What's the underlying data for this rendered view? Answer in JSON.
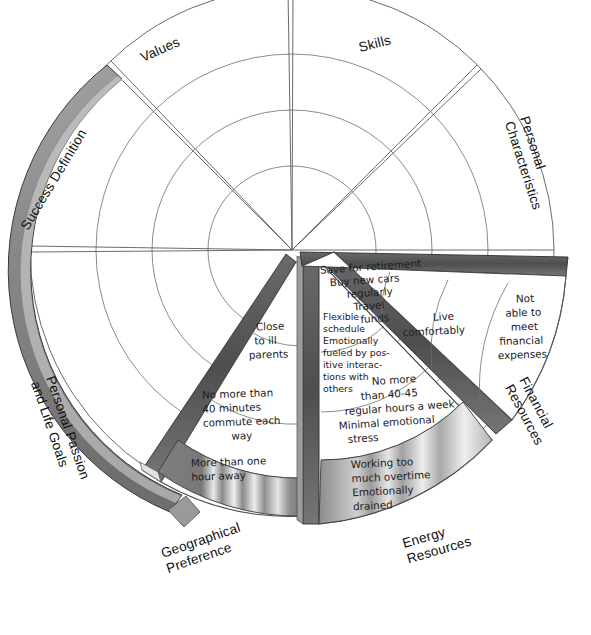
{
  "diagram": {
    "type": "segmented-wheel",
    "center": {
      "x": 292,
      "y": 250
    },
    "outer_radius": 262,
    "ring_radii": [
      84,
      140,
      196,
      262
    ],
    "ring_count": 3,
    "style": "hand-drawn pencil sketch, 3D exploded pie segments",
    "colors": {
      "ink": "#2e2e2e",
      "face": "#ffffff",
      "edge_dark": "#585858",
      "edge_mid": "#8d8d8d",
      "edge_light": "#c9c9c9",
      "background": "#ffffff"
    }
  },
  "sectors": [
    {
      "id": "skills",
      "label": "Skills",
      "label_lines": [
        "Skills"
      ],
      "exploded": false
    },
    {
      "id": "personal-characteristics",
      "label": "Personal Characteristics",
      "label_lines": [
        "Personal",
        "Characteristics"
      ],
      "exploded": false
    },
    {
      "id": "financial-resources",
      "label": "Financial Resources",
      "label_lines": [
        "Financial",
        "Resources"
      ],
      "exploded": true
    },
    {
      "id": "energy-resources",
      "label": "Energy Resources",
      "label_lines": [
        "Energy",
        "Resources"
      ],
      "exploded": true
    },
    {
      "id": "geographical-preference",
      "label": "Geographical Preference",
      "label_lines": [
        "Geographical",
        "Preference"
      ],
      "exploded": true
    },
    {
      "id": "personal-passion",
      "label": "Personal Passion and Life Goals",
      "label_lines": [
        "Personal Passion",
        "and Life Goals"
      ],
      "exploded": false
    },
    {
      "id": "success-definition",
      "label": "Success Definition",
      "label_lines": [
        "Success Definition"
      ],
      "exploded": false
    },
    {
      "id": "values",
      "label": "Values",
      "label_lines": [
        "Values"
      ],
      "exploded": false
    }
  ],
  "cells": [
    {
      "id": "financial-inner",
      "sector": "financial-resources",
      "ring": 2,
      "lines": [
        "Save for retirement",
        "Buy new cars",
        "regularly",
        "Travel",
        "funds"
      ]
    },
    {
      "id": "financial-middle",
      "sector": "financial-resources",
      "ring": 3,
      "lines": [
        "Live",
        "comfortably"
      ]
    },
    {
      "id": "financial-outer",
      "sector": "financial-resources",
      "ring": 4,
      "lines": [
        "Not",
        "able to",
        "meet",
        "financial",
        "expenses"
      ]
    },
    {
      "id": "energy-inner",
      "sector": "energy-resources",
      "ring": 2,
      "lines": [
        "Flexible",
        "schedule",
        "Emotionally",
        "fueled by pos-",
        "itive interac-",
        "tions with",
        "others"
      ]
    },
    {
      "id": "energy-middle",
      "sector": "energy-resources",
      "ring": 3,
      "lines": [
        "No more",
        "than 40-45",
        "regular hours a week",
        "Minimal emotional",
        "stress"
      ]
    },
    {
      "id": "energy-outer",
      "sector": "energy-resources",
      "ring": 4,
      "lines": [
        "Working too",
        "much overtime",
        "Emotionally",
        "drained"
      ]
    },
    {
      "id": "geographical-inner",
      "sector": "geographical-preference",
      "ring": 2,
      "lines": [
        "Close",
        "to ill",
        "parents"
      ]
    },
    {
      "id": "geographical-middle",
      "sector": "geographical-preference",
      "ring": 3,
      "lines": [
        "No more than",
        "40 minutes",
        "commute each",
        "way"
      ]
    },
    {
      "id": "geographical-outer",
      "sector": "geographical-preference",
      "ring": 4,
      "lines": [
        "More than one",
        "hour away"
      ]
    }
  ]
}
